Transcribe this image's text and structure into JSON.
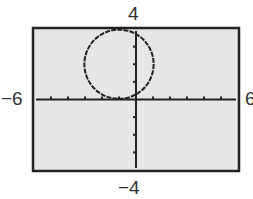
{
  "chart_data": {
    "type": "line",
    "title": "",
    "xlabel": "",
    "ylabel": "",
    "xlim": [
      -6,
      6
    ],
    "ylim": [
      -4,
      4
    ],
    "window_labels": {
      "xmin": "−6",
      "xmax": "6",
      "ymin": "−4",
      "ymax": "4"
    },
    "x_ticks": [
      -5,
      -4,
      -3,
      -2,
      -1,
      0,
      1,
      2,
      3,
      4,
      5
    ],
    "y_ticks": [
      -3,
      -2,
      -1,
      0,
      1,
      2,
      3
    ],
    "grid": false,
    "legend": null,
    "series": [
      {
        "name": "circle",
        "shape": "circle",
        "center": [
          -1,
          2
        ],
        "radius": 2,
        "equation": "(x+1)^2 + (y-2)^2 = 4"
      }
    ]
  },
  "colors": {
    "screen_bg": "#e6e6e6",
    "frame": "#222222",
    "curve": "#222222",
    "axes": "#222222"
  }
}
